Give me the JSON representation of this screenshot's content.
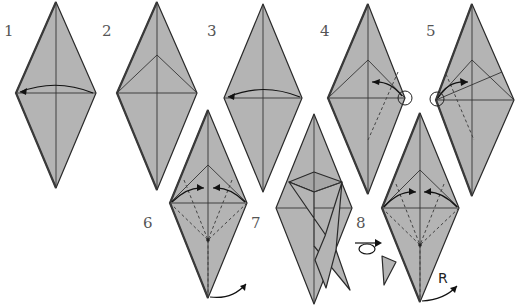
{
  "diagram": {
    "paper_color": "#b4b4b4",
    "line_color": "#2a2a2a",
    "steps": [
      {
        "number": "1",
        "action": "fold right flap to left (valley fold along center)"
      },
      {
        "number": "2",
        "action": "result with triangular flap on top"
      },
      {
        "number": "3",
        "action": "fold right flap to left"
      },
      {
        "number": "4",
        "action": "reverse fold at circled corner"
      },
      {
        "number": "5",
        "action": "reverse fold at circled corner"
      },
      {
        "number": "6",
        "action": "fold edges to center, rotate"
      },
      {
        "number": "7",
        "action": "result with crossed flaps"
      },
      {
        "number": "8",
        "action": "turn over; fold edges to center; rotate"
      }
    ],
    "symbols": {
      "rotate_label": "R",
      "turn_over": "turn-over-symbol"
    }
  }
}
